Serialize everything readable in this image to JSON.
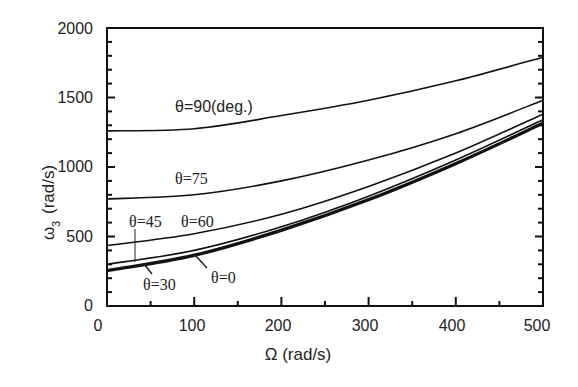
{
  "chart_data": {
    "type": "line",
    "title": "",
    "xlabel": "Ω (rad/s)",
    "ylabel": "ω3 (rad/s)",
    "xlim": [
      0,
      500
    ],
    "ylim": [
      0,
      2000
    ],
    "xticks": [
      0,
      100,
      200,
      300,
      400,
      500
    ],
    "yticks": [
      0,
      500,
      1000,
      1500,
      2000
    ],
    "grid": false,
    "legend": "inline curve labels",
    "x": [
      0,
      100,
      200,
      300,
      400,
      500
    ],
    "series": [
      {
        "name": "θ=90(deg.)",
        "values": [
          1260,
          1275,
          1370,
          1480,
          1620,
          1790
        ]
      },
      {
        "name": "θ=75",
        "values": [
          770,
          800,
          900,
          1050,
          1240,
          1480
        ]
      },
      {
        "name": "θ=60",
        "values": [
          435,
          520,
          660,
          860,
          1100,
          1380
        ]
      },
      {
        "name": "θ=45",
        "values": [
          300,
          400,
          570,
          790,
          1050,
          1340
        ]
      },
      {
        "name": "θ=30",
        "values": [
          260,
          370,
          550,
          770,
          1030,
          1320
        ]
      },
      {
        "name": "θ=0",
        "values": [
          250,
          360,
          540,
          760,
          1020,
          1310
        ]
      }
    ]
  },
  "labels": {
    "xaxis_title": "Ω (rad/s)",
    "yaxis_title_main": "ω",
    "yaxis_title_sub": "3",
    "yaxis_title_unit": "(rad/s)",
    "xticks": [
      "0",
      "100",
      "200",
      "300",
      "400",
      "500"
    ],
    "yticks": [
      "0",
      "500",
      "1000",
      "1500",
      "2000"
    ],
    "curves": {
      "t90": "θ=90(deg.)",
      "t75": "θ=75",
      "t60": "θ=60",
      "t45": "θ=45",
      "t30": "θ=30",
      "t0": "θ=0"
    }
  }
}
